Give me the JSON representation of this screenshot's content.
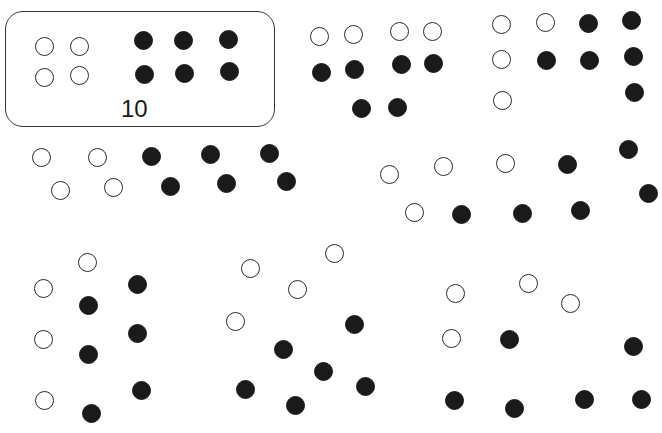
{
  "diagram": {
    "colors": {
      "white_fill": "#ffffff",
      "black_fill": "#1a1a1a",
      "stroke": "#2a2a2a"
    },
    "framed_group_label": "10",
    "groups": [
      {
        "id": "group-1-framed",
        "white_count": 4,
        "black_count": 6,
        "white": [
          [
            44,
            46
          ],
          [
            79,
            46
          ],
          [
            44,
            77
          ],
          [
            79,
            75
          ]
        ],
        "black": [
          [
            143,
            40
          ],
          [
            183,
            40
          ],
          [
            228,
            39
          ],
          [
            144,
            74
          ],
          [
            184,
            73
          ],
          [
            229,
            71
          ]
        ]
      },
      {
        "id": "group-2",
        "white_count": 4,
        "black_count": 6,
        "white": [
          [
            319,
            36
          ],
          [
            353,
            34
          ],
          [
            399,
            31
          ],
          [
            432,
            31
          ]
        ],
        "black": [
          [
            321,
            72
          ],
          [
            354,
            69
          ],
          [
            401,
            64
          ],
          [
            433,
            63
          ],
          [
            361,
            108
          ],
          [
            397,
            107
          ]
        ]
      },
      {
        "id": "group-3",
        "white_count": 4,
        "black_count": 6,
        "white": [
          [
            501,
            24
          ],
          [
            545,
            22
          ],
          [
            501,
            59
          ],
          [
            502,
            100
          ]
        ],
        "black": [
          [
            588,
            23
          ],
          [
            631,
            20
          ],
          [
            546,
            60
          ],
          [
            589,
            60
          ],
          [
            633,
            56
          ],
          [
            634,
            92
          ]
        ]
      },
      {
        "id": "group-4",
        "white_count": 4,
        "black_count": 6,
        "white": [
          [
            41,
            157
          ],
          [
            97,
            157
          ],
          [
            60,
            190
          ],
          [
            113,
            187
          ]
        ],
        "black": [
          [
            151,
            156
          ],
          [
            210,
            154
          ],
          [
            269,
            153
          ],
          [
            170,
            186
          ],
          [
            226,
            183
          ],
          [
            286,
            181
          ]
        ]
      },
      {
        "id": "group-5",
        "white_count": 4,
        "black_count": 6,
        "white": [
          [
            389,
            174
          ],
          [
            443,
            166
          ],
          [
            505,
            163
          ],
          [
            414,
            212
          ]
        ],
        "black": [
          [
            567,
            164
          ],
          [
            628,
            149
          ],
          [
            648,
            193
          ],
          [
            461,
            214
          ],
          [
            522,
            213
          ],
          [
            580,
            210
          ]
        ]
      },
      {
        "id": "group-6",
        "white_count": 4,
        "black_count": 6,
        "white": [
          [
            87,
            262
          ],
          [
            43,
            288
          ],
          [
            43,
            339
          ],
          [
            44,
            400
          ]
        ],
        "black": [
          [
            137,
            284
          ],
          [
            88,
            305
          ],
          [
            137,
            333
          ],
          [
            88,
            354
          ],
          [
            141,
            390
          ],
          [
            91,
            413
          ]
        ]
      },
      {
        "id": "group-7",
        "white_count": 4,
        "black_count": 6,
        "white": [
          [
            250,
            268
          ],
          [
            334,
            253
          ],
          [
            297,
            289
          ],
          [
            235,
            321
          ]
        ],
        "black": [
          [
            354,
            324
          ],
          [
            283,
            349
          ],
          [
            323,
            371
          ],
          [
            365,
            386
          ],
          [
            245,
            389
          ],
          [
            295,
            405
          ]
        ]
      },
      {
        "id": "group-8",
        "white_count": 4,
        "black_count": 6,
        "white": [
          [
            455,
            293
          ],
          [
            528,
            283
          ],
          [
            570,
            303
          ],
          [
            451,
            338
          ]
        ],
        "black": [
          [
            509,
            339
          ],
          [
            633,
            346
          ],
          [
            454,
            400
          ],
          [
            514,
            408
          ],
          [
            584,
            399
          ],
          [
            641,
            399
          ]
        ]
      }
    ]
  }
}
